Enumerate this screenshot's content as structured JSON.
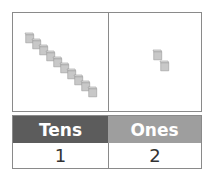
{
  "columns": [
    {
      "label": "Tens",
      "value": "1",
      "header_color": "#5c5c5c",
      "blocks": "ten-rod",
      "block_count": 10
    },
    {
      "label": "Ones",
      "value": "2",
      "header_color": "#9e9e9e",
      "blocks": "unit-cube",
      "block_count": 2
    }
  ],
  "colors": {
    "border": "#8a8a8a",
    "block_fill": "#c8c8c8",
    "block_edge": "#9a9a9a"
  }
}
